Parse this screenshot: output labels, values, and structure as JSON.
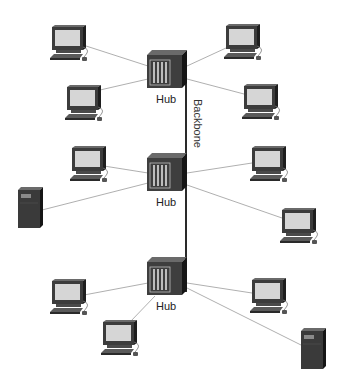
{
  "diagram": {
    "type": "network-topology",
    "backbone": {
      "label": "Backbone",
      "x": 186,
      "y1": 62,
      "y2": 292
    },
    "hubs": [
      {
        "id": "hub1",
        "label": "Hub",
        "x": 147,
        "y": 50
      },
      {
        "id": "hub2",
        "label": "Hub",
        "x": 147,
        "y": 153
      },
      {
        "id": "hub3",
        "label": "Hub",
        "x": 147,
        "y": 257
      }
    ],
    "workstations": [
      {
        "id": "pc1",
        "hub": "hub1",
        "x": 50,
        "y": 25
      },
      {
        "id": "pc2",
        "hub": "hub1",
        "x": 224,
        "y": 24
      },
      {
        "id": "pc3",
        "hub": "hub1",
        "x": 65,
        "y": 85
      },
      {
        "id": "pc4",
        "hub": "hub1",
        "x": 242,
        "y": 84
      },
      {
        "id": "pc5",
        "hub": "hub2",
        "x": 70,
        "y": 146
      },
      {
        "id": "pc6",
        "hub": "hub2",
        "x": 250,
        "y": 146
      },
      {
        "id": "pc7",
        "hub": "hub2",
        "x": 280,
        "y": 208
      },
      {
        "id": "pc8",
        "hub": "hub3",
        "x": 50,
        "y": 279
      },
      {
        "id": "pc9",
        "hub": "hub3",
        "x": 250,
        "y": 278
      },
      {
        "id": "pc10",
        "hub": "hub3",
        "x": 101,
        "y": 320
      }
    ],
    "servers": [
      {
        "id": "server1",
        "hub": "hub2",
        "x": 18,
        "y": 187
      },
      {
        "id": "server2",
        "hub": "hub3",
        "x": 301,
        "y": 328
      }
    ],
    "colors": {
      "device_dark": "#3c3c3c",
      "device_side": "#1e1e1e",
      "screen": "#d2d2d2",
      "link": "#9a9a9a",
      "backbone": "#2a2a2a"
    }
  }
}
